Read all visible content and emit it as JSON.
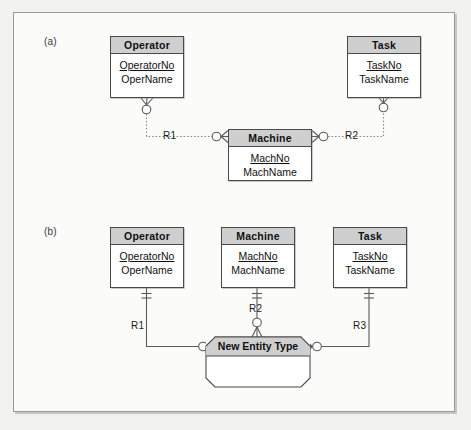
{
  "figure": {
    "background": "#f2f2f0",
    "paper": "#fbfbfa",
    "header_fill": "#cfcfcf",
    "line_color": "#4a4a4a"
  },
  "parts": {
    "a": {
      "label": "(a)"
    },
    "b": {
      "label": "(b)"
    }
  },
  "part_a": {
    "entities": [
      {
        "name": "operator",
        "title": "Operator",
        "attributes": [
          {
            "text": "OperatorNo",
            "primary_key": true
          },
          {
            "text": "OperName",
            "primary_key": false
          }
        ]
      },
      {
        "name": "task",
        "title": "Task",
        "attributes": [
          {
            "text": "TaskNo",
            "primary_key": true
          },
          {
            "text": "TaskName",
            "primary_key": false
          }
        ]
      },
      {
        "name": "machine",
        "title": "Machine",
        "attributes": [
          {
            "text": "MachNo",
            "primary_key": true
          },
          {
            "text": "MachName",
            "primary_key": false
          }
        ]
      }
    ],
    "relationships": [
      {
        "name": "r1",
        "label": "R1",
        "from": "Operator",
        "to": "Machine",
        "from_cardinality": "zero-or-one",
        "to_cardinality": "zero-or-many"
      },
      {
        "name": "r2",
        "label": "R2",
        "from": "Machine",
        "to": "Task",
        "from_cardinality": "zero-or-many",
        "to_cardinality": "zero-or-one"
      }
    ]
  },
  "part_b": {
    "entities": [
      {
        "name": "operator",
        "title": "Operator",
        "attributes": [
          {
            "text": "OperatorNo",
            "primary_key": true
          },
          {
            "text": "OperName",
            "primary_key": false
          }
        ]
      },
      {
        "name": "machine",
        "title": "Machine",
        "attributes": [
          {
            "text": "MachNo",
            "primary_key": true
          },
          {
            "text": "MachName",
            "primary_key": false
          }
        ]
      },
      {
        "name": "task",
        "title": "Task",
        "attributes": [
          {
            "text": "TaskNo",
            "primary_key": true
          },
          {
            "text": "TaskName",
            "primary_key": false
          }
        ]
      }
    ],
    "associative_entity": {
      "name": "new-entity-type",
      "title": "New Entity Type",
      "attributes": []
    },
    "relationships": [
      {
        "name": "r1",
        "label": "R1",
        "from": "Operator",
        "to": "New Entity Type",
        "from_cardinality": "exactly-one",
        "to_cardinality": "zero-or-many"
      },
      {
        "name": "r2",
        "label": "R2",
        "from": "Machine",
        "to": "New Entity Type",
        "from_cardinality": "exactly-one",
        "to_cardinality": "zero-or-many"
      },
      {
        "name": "r3",
        "label": "R3",
        "from": "Task",
        "to": "New Entity Type",
        "from_cardinality": "exactly-one",
        "to_cardinality": "zero-or-many"
      }
    ]
  }
}
